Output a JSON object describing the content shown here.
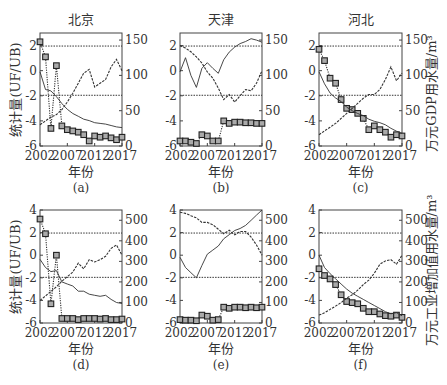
{
  "figure": {
    "left_axis_label": "统计量(UF/UB)",
    "right_axis_label_top": "万元GDP用水量/m³",
    "right_axis_label_bottom": "万元工业增加值用水量/m³",
    "x_label": "年份",
    "legend": {
      "uf": "UF (dotted with squares)",
      "ub": "UB (dashed)",
      "water": "Water use per unit (solid)"
    }
  },
  "chart_data": [
    {
      "type": "line",
      "panel": "(a)",
      "title": "北京",
      "row": 0,
      "col": 0,
      "x": [
        2002,
        2003,
        2004,
        2005,
        2006,
        2007,
        2008,
        2009,
        2010,
        2011,
        2012,
        2013,
        2014,
        2015,
        2016,
        2017
      ],
      "xticks": [
        2002,
        2007,
        2012,
        2017
      ],
      "ylim": [
        -6,
        3
      ],
      "yticks": [
        -6,
        -4,
        -2,
        0,
        2
      ],
      "y2lim": [
        0,
        160
      ],
      "y2ticks": [
        0,
        50,
        100,
        150
      ],
      "critical_lines": [
        1.96,
        -1.96
      ],
      "series": [
        {
          "name": "UF",
          "style": "square-dotted",
          "values": [
            2.3,
            1.1,
            -4.6,
            0.4,
            -4.4,
            -4.7,
            -4.8,
            -4.9,
            -5.1,
            -5.6,
            -5.2,
            -5.3,
            -5.2,
            -5.35,
            -5.5,
            -5.3
          ]
        },
        {
          "name": "UB",
          "style": "dashed",
          "values": [
            -4.3,
            -4.0,
            -3.7,
            -3.5,
            -3.1,
            -2.5,
            -1.8,
            -1.0,
            -0.2,
            0.1,
            -1.3,
            -1.0,
            -0.7,
            0.3,
            0.9,
            0.0
          ]
        },
        {
          "name": "water_use",
          "style": "solid",
          "axis": "right",
          "values": [
            105,
            80,
            78,
            70,
            60,
            52,
            46,
            42,
            38,
            36,
            33,
            32,
            31,
            29,
            27,
            26
          ]
        }
      ]
    },
    {
      "type": "line",
      "panel": "(b)",
      "title": "天津",
      "row": 0,
      "col": 1,
      "x": [
        2002,
        2003,
        2004,
        2005,
        2006,
        2007,
        2008,
        2009,
        2010,
        2011,
        2012,
        2013,
        2014,
        2015,
        2016,
        2017
      ],
      "xticks": [
        2002,
        2007,
        2012,
        2017
      ],
      "ylim": [
        -6,
        3
      ],
      "yticks": [
        -6,
        -4,
        -2,
        0,
        2
      ],
      "y2lim": [
        0,
        160
      ],
      "y2ticks": [
        0,
        50,
        100,
        150
      ],
      "critical_lines": [
        1.96,
        -1.96
      ],
      "series": [
        {
          "name": "UF",
          "style": "square-dotted",
          "values": [
            -5.6,
            -5.6,
            -5.7,
            -5.8,
            -5.1,
            -5.2,
            -5.6,
            -5.6,
            -4.0,
            -4.2,
            -4.1,
            -4.1,
            -4.15,
            -4.15,
            -4.2,
            -4.2
          ]
        },
        {
          "name": "UB",
          "style": "dashed",
          "values": [
            2.0,
            1.8,
            1.5,
            1.1,
            0.6,
            -0.1,
            -0.6,
            -1.4,
            -2.3,
            -1.9,
            -2.5,
            -2.0,
            -1.5,
            -1.6,
            -1.0,
            0.0
          ]
        },
        {
          "name": "water_use",
          "style": "solid",
          "axis": "right",
          "values": [
            105,
            125,
            100,
            83,
            110,
            118,
            110,
            103,
            122,
            133,
            140,
            145,
            148,
            152,
            150,
            147
          ]
        }
      ]
    },
    {
      "type": "line",
      "panel": "(c)",
      "title": "河北",
      "row": 0,
      "col": 2,
      "x": [
        2002,
        2003,
        2004,
        2005,
        2006,
        2007,
        2008,
        2009,
        2010,
        2011,
        2012,
        2013,
        2014,
        2015,
        2016,
        2017
      ],
      "xticks": [
        2002,
        2007,
        2012,
        2017
      ],
      "ylim": [
        -6,
        3
      ],
      "yticks": [
        -6,
        -4,
        -2,
        0,
        2
      ],
      "y2lim": [
        0,
        160
      ],
      "y2ticks": [
        0,
        50,
        100,
        150
      ],
      "y2label": "right_axis_label_top",
      "critical_lines": [
        1.96,
        -1.96
      ],
      "series": [
        {
          "name": "UF",
          "style": "square-dotted",
          "values": [
            1.7,
            0.8,
            -0.6,
            -1.0,
            -2.3,
            -3.0,
            -3.1,
            -3.4,
            -3.8,
            -4.7,
            -4.4,
            -4.7,
            -4.9,
            -5.3,
            -5.1,
            -5.2
          ]
        },
        {
          "name": "UB",
          "style": "dashed",
          "values": [
            -5.1,
            -4.8,
            -4.5,
            -4.2,
            -3.8,
            -3.4,
            -3.0,
            -2.6,
            -2.2,
            -1.9,
            -1.9,
            -1.5,
            -0.7,
            0.3,
            -0.8,
            -0.2
          ]
        },
        {
          "name": "water_use",
          "style": "solid",
          "axis": "right",
          "values": [
            105,
            88,
            75,
            68,
            63,
            55,
            50,
            46,
            43,
            38,
            35,
            33,
            30,
            25,
            21,
            18
          ]
        }
      ]
    },
    {
      "type": "line",
      "panel": "(d)",
      "title": "",
      "row": 1,
      "col": 0,
      "x": [
        2002,
        2003,
        2004,
        2005,
        2006,
        2007,
        2008,
        2009,
        2010,
        2011,
        2012,
        2013,
        2014,
        2015,
        2016,
        2017
      ],
      "xticks": [
        2002,
        2007,
        2012,
        2017
      ],
      "ylim": [
        -6,
        4
      ],
      "yticks": [
        -6,
        -4,
        -2,
        0,
        2,
        4
      ],
      "y2lim": [
        0,
        550
      ],
      "y2ticks": [
        0,
        100,
        200,
        300,
        400,
        500
      ],
      "critical_lines": [
        1.96,
        -1.96
      ],
      "series": [
        {
          "name": "UF",
          "style": "square-dotted",
          "values": [
            3.2,
            1.9,
            -4.3,
            0.0,
            -5.6,
            -5.6,
            -5.6,
            -5.7,
            -5.6,
            -5.6,
            -5.6,
            -5.65,
            -5.6,
            -5.7,
            -5.7,
            -5.65
          ]
        },
        {
          "name": "UB",
          "style": "dashed",
          "values": [
            -4.0,
            -3.6,
            -3.2,
            -2.8,
            -2.3,
            -1.9,
            -1.5,
            -0.7,
            -1.2,
            -0.4,
            -0.6,
            -0.4,
            -0.1,
            0.6,
            0.9,
            0.0
          ]
        },
        {
          "name": "water_use",
          "style": "solid",
          "axis": "right",
          "values": [
            310,
            270,
            250,
            255,
            200,
            190,
            180,
            155,
            155,
            140,
            135,
            130,
            135,
            115,
            100,
            95
          ]
        }
      ]
    },
    {
      "type": "line",
      "panel": "(e)",
      "title": "",
      "row": 1,
      "col": 1,
      "x": [
        2002,
        2003,
        2004,
        2005,
        2006,
        2007,
        2008,
        2009,
        2010,
        2011,
        2012,
        2013,
        2014,
        2015,
        2016,
        2017
      ],
      "xticks": [
        2002,
        2007,
        2012,
        2017
      ],
      "ylim": [
        -6,
        4
      ],
      "yticks": [
        -6,
        -4,
        -2,
        0,
        2,
        4
      ],
      "y2lim": [
        0,
        550
      ],
      "y2ticks": [
        0,
        100,
        200,
        300,
        400,
        500
      ],
      "critical_lines": [
        1.96,
        -1.96
      ],
      "series": [
        {
          "name": "UF",
          "style": "square-dotted",
          "values": [
            -5.7,
            -5.75,
            -5.75,
            -5.8,
            -5.3,
            -5.4,
            -5.75,
            -5.7,
            -4.6,
            -4.7,
            -4.6,
            -4.6,
            -4.65,
            -4.6,
            -4.65,
            -4.6
          ]
        },
        {
          "name": "UB",
          "style": "dashed",
          "values": [
            3.8,
            3.7,
            3.5,
            3.3,
            2.9,
            2.9,
            2.7,
            2.3,
            1.9,
            2.2,
            1.8,
            2.1,
            2.1,
            1.6,
            0.9,
            0.0
          ]
        },
        {
          "name": "water_use",
          "style": "solid",
          "axis": "right",
          "values": [
            320,
            270,
            245,
            220,
            280,
            335,
            355,
            375,
            410,
            430,
            450,
            460,
            475,
            500,
            525,
            550
          ]
        }
      ]
    },
    {
      "type": "line",
      "panel": "(f)",
      "title": "",
      "row": 1,
      "col": 2,
      "x": [
        2002,
        2003,
        2004,
        2005,
        2006,
        2007,
        2008,
        2009,
        2010,
        2011,
        2012,
        2013,
        2014,
        2015,
        2016,
        2017
      ],
      "xticks": [
        2002,
        2007,
        2012,
        2017
      ],
      "ylim": [
        -6,
        4
      ],
      "yticks": [
        -6,
        -4,
        -2,
        0,
        2,
        4
      ],
      "y2lim": [
        0,
        550
      ],
      "y2ticks": [
        0,
        100,
        200,
        300,
        400,
        500
      ],
      "y2label": "right_axis_label_bottom",
      "critical_lines": [
        1.96,
        -1.96
      ],
      "series": [
        {
          "name": "UF",
          "style": "square-dotted",
          "values": [
            -1.2,
            -1.8,
            -2.1,
            -2.6,
            -3.5,
            -4.1,
            -4.2,
            -4.3,
            -4.7,
            -5.0,
            -5.0,
            -5.2,
            -5.35,
            -5.4,
            -5.3,
            -5.5
          ]
        },
        {
          "name": "UB",
          "style": "dashed",
          "values": [
            -5.3,
            -5.1,
            -4.8,
            -4.5,
            -4.2,
            -3.8,
            -3.5,
            -3.1,
            -2.6,
            -2.2,
            -1.6,
            -0.8,
            -0.5,
            -0.4,
            -0.8,
            0.0
          ]
        },
        {
          "name": "water_use",
          "style": "solid",
          "axis": "right",
          "values": [
            330,
            270,
            240,
            215,
            190,
            165,
            145,
            130,
            115,
            100,
            85,
            70,
            55,
            45,
            50,
            35
          ]
        }
      ]
    }
  ]
}
